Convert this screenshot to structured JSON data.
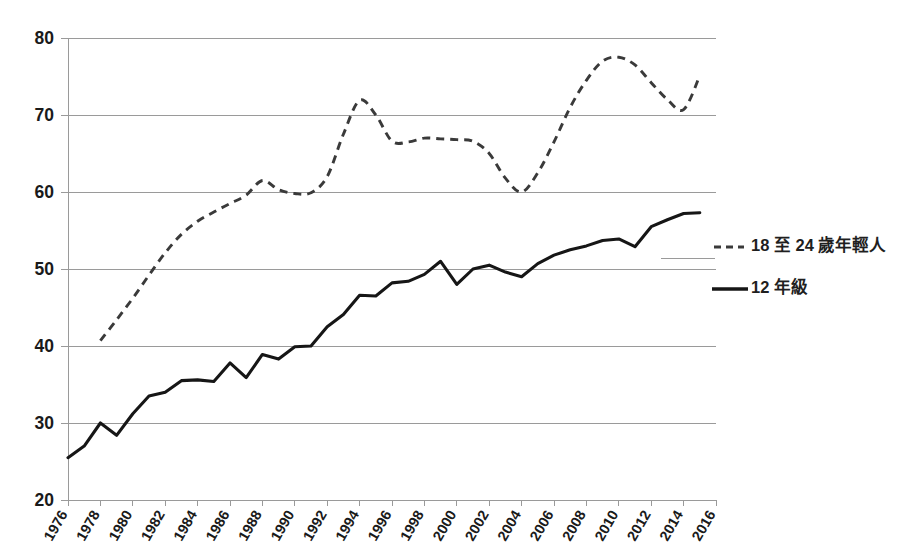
{
  "chart_data": {
    "type": "line",
    "title": "",
    "subtitle": "",
    "xlabel": "",
    "ylabel": "",
    "xlim": [
      1976,
      2016
    ],
    "ylim": [
      20,
      80
    ],
    "grid": true,
    "legend_position": "right",
    "y_ticks": [
      20,
      30,
      40,
      50,
      60,
      70,
      80
    ],
    "x_ticks": [
      1976,
      1978,
      1980,
      1982,
      1984,
      1986,
      1988,
      1990,
      1992,
      1994,
      1996,
      1998,
      2000,
      2002,
      2004,
      2006,
      2008,
      2010,
      2012,
      2014,
      2016
    ],
    "series": [
      {
        "name": "18 至 24 歲年輕人",
        "style": "dashed",
        "color": "#3a3a3a",
        "x": [
          1978,
          1979,
          1980,
          1981,
          1982,
          1983,
          1984,
          1985,
          1986,
          1987,
          1988,
          1989,
          1990,
          1991,
          1992,
          1993,
          1994,
          1995,
          1996,
          1997,
          1998,
          1999,
          2000,
          2001,
          2002,
          2003,
          2004,
          2005,
          2006,
          2007,
          2008,
          2009,
          2010,
          2011,
          2012,
          2013,
          2014,
          2015
        ],
        "values": [
          40.7,
          43.4,
          46.2,
          49.2,
          52.1,
          54.5,
          56.2,
          57.4,
          58.5,
          59.6,
          61.5,
          60.3,
          59.8,
          59.9,
          62.0,
          67.5,
          71.9,
          70.0,
          66.6,
          66.5,
          67.0,
          66.9,
          66.8,
          66.6,
          65.0,
          61.8,
          60.0,
          62.5,
          66.5,
          71.0,
          74.5,
          77.0,
          77.5,
          76.5,
          74.2,
          72.0,
          70.7,
          75.1
        ]
      },
      {
        "name": "12 年級",
        "style": "solid",
        "color": "#161616",
        "x": [
          1976,
          1977,
          1978,
          1979,
          1980,
          1981,
          1982,
          1983,
          1984,
          1985,
          1986,
          1987,
          1988,
          1989,
          1990,
          1991,
          1992,
          1993,
          1994,
          1995,
          1996,
          1997,
          1998,
          1999,
          2000,
          2001,
          2002,
          2003,
          2004,
          2005,
          2006,
          2007,
          2008,
          2009,
          2010,
          2011,
          2012,
          2013,
          2014,
          2015
        ],
        "values": [
          25.5,
          27.0,
          30.0,
          28.4,
          31.2,
          33.5,
          34.0,
          35.5,
          35.6,
          35.4,
          37.8,
          35.9,
          38.9,
          38.3,
          39.9,
          40.0,
          42.5,
          44.1,
          46.6,
          46.5,
          48.2,
          48.4,
          49.3,
          51.0,
          48.0,
          50.0,
          50.5,
          49.6,
          49.0,
          50.7,
          51.8,
          52.5,
          53.0,
          53.7,
          53.9,
          52.9,
          55.5,
          56.4,
          57.2,
          57.3
        ]
      }
    ]
  },
  "legend": {
    "items": [
      {
        "label": "18 至 24 歲年輕人",
        "style": "dashed"
      },
      {
        "label": "12 年級",
        "style": "solid"
      }
    ]
  }
}
